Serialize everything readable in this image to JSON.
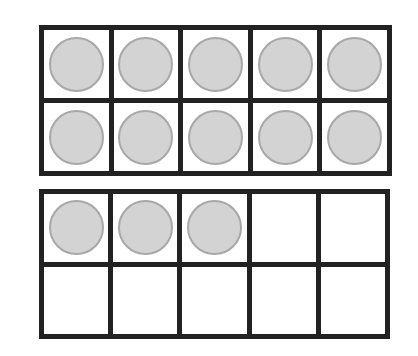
{
  "title": "",
  "colors": {
    "border": "#222222",
    "cell": "#ffffff",
    "counter_fill": "#d3d3d3",
    "counter_stroke": "#a8a8a8"
  },
  "frames": [
    {
      "name": "ten-frame-1",
      "rows": 2,
      "cols": 5,
      "filled": 10,
      "cells": [
        1,
        1,
        1,
        1,
        1,
        1,
        1,
        1,
        1,
        1
      ]
    },
    {
      "name": "ten-frame-2",
      "rows": 2,
      "cols": 5,
      "filled": 3,
      "cells": [
        1,
        1,
        1,
        0,
        0,
        0,
        0,
        0,
        0,
        0
      ]
    }
  ],
  "total_counters": 13
}
